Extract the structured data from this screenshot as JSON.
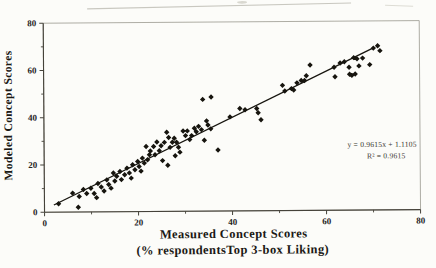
{
  "figure": {
    "background": "#fcfcf9",
    "ink": "#1a1813",
    "frame_color": "#9a988f",
    "axis_color": "#45423a",
    "marker_color": "#17150f",
    "trendline_color": "#17150f",
    "scan_artifact_color": "#c9c8c0"
  },
  "chart_data": {
    "type": "scatter",
    "title": "",
    "xlabel_line1": "Measured Concept Scores",
    "xlabel_line2": "(% respondentsTop 3-box Liking)",
    "ylabel": "Modeled Concept Scores",
    "xlim": [
      0,
      80
    ],
    "ylim": [
      0,
      80
    ],
    "xticks": [
      0,
      20,
      40,
      60,
      80
    ],
    "yticks": [
      0,
      20,
      40,
      60,
      80
    ],
    "minor_tick_step": 10,
    "grid": "off",
    "legend": "none",
    "marker": "diamond",
    "annotation": {
      "equation": "y = 0.9615x + 1.1105",
      "r_squared": "R² = 0.9615"
    },
    "trendline": {
      "slope": 0.9615,
      "intercept": 1.1105,
      "x_start": 2.0,
      "x_end": 70.3
    },
    "points": [
      [
        3.0,
        3.5
      ],
      [
        7.2,
        2.0
      ],
      [
        6.0,
        8.0
      ],
      [
        7.4,
        6.5
      ],
      [
        8.3,
        9.5
      ],
      [
        9.0,
        7.8
      ],
      [
        9.9,
        10.0
      ],
      [
        10.6,
        7.8
      ],
      [
        11.1,
        6.0
      ],
      [
        11.4,
        12.0
      ],
      [
        12.1,
        10.5
      ],
      [
        12.7,
        8.8
      ],
      [
        13.3,
        13.5
      ],
      [
        13.7,
        11.5
      ],
      [
        14.2,
        10.0
      ],
      [
        14.7,
        16.4
      ],
      [
        15.0,
        13.0
      ],
      [
        15.4,
        15.0
      ],
      [
        16.1,
        17.0
      ],
      [
        16.4,
        13.6
      ],
      [
        17.1,
        15.6
      ],
      [
        17.6,
        18.4
      ],
      [
        18.1,
        16.4
      ],
      [
        18.5,
        14.2
      ],
      [
        18.8,
        19.8
      ],
      [
        19.3,
        17.7
      ],
      [
        19.9,
        21.2
      ],
      [
        20.2,
        19.1
      ],
      [
        20.6,
        17.1
      ],
      [
        20.9,
        22.6
      ],
      [
        21.3,
        20.5
      ],
      [
        22.0,
        21.9
      ],
      [
        22.4,
        24.0
      ],
      [
        21.7,
        27.5
      ],
      [
        22.6,
        25.6
      ],
      [
        23.3,
        27.5
      ],
      [
        23.6,
        24.0
      ],
      [
        24.0,
        29.4
      ],
      [
        24.5,
        25.7
      ],
      [
        24.9,
        27.8
      ],
      [
        25.2,
        21.5
      ],
      [
        25.6,
        29.2
      ],
      [
        26.1,
        33.5
      ],
      [
        26.3,
        19.5
      ],
      [
        26.5,
        31.3
      ],
      [
        26.8,
        27.1
      ],
      [
        27.3,
        29.2
      ],
      [
        27.7,
        30.9
      ],
      [
        27.9,
        23.5
      ],
      [
        28.2,
        29.2
      ],
      [
        28.6,
        27.1
      ],
      [
        28.9,
        25.0
      ],
      [
        29.6,
        34.0
      ],
      [
        30.1,
        32.0
      ],
      [
        30.5,
        34.0
      ],
      [
        31.0,
        30.3
      ],
      [
        31.4,
        32.0
      ],
      [
        32.0,
        35.1
      ],
      [
        32.4,
        33.6
      ],
      [
        32.9,
        35.9
      ],
      [
        33.5,
        34.5
      ],
      [
        34.1,
        30.0
      ],
      [
        34.6,
        38.2
      ],
      [
        34.9,
        36.4
      ],
      [
        35.5,
        34.8
      ],
      [
        37.0,
        25.8
      ],
      [
        33.8,
        47.3
      ],
      [
        35.6,
        48.3
      ],
      [
        39.6,
        39.8
      ],
      [
        41.7,
        43.3
      ],
      [
        42.8,
        42.8
      ],
      [
        45.3,
        43.3
      ],
      [
        45.6,
        41.5
      ],
      [
        46.2,
        38.5
      ],
      [
        50.8,
        53.0
      ],
      [
        51.3,
        50.6
      ],
      [
        52.7,
        51.6
      ],
      [
        53.2,
        51.0
      ],
      [
        53.9,
        54.0
      ],
      [
        54.8,
        55.0
      ],
      [
        55.5,
        55.0
      ],
      [
        55.9,
        57.0
      ],
      [
        56.7,
        61.5
      ],
      [
        61.8,
        60.5
      ],
      [
        62.0,
        56.5
      ],
      [
        63.1,
        62.3
      ],
      [
        64.0,
        62.8
      ],
      [
        65.0,
        60.5
      ],
      [
        65.1,
        57.5
      ],
      [
        65.6,
        57.0
      ],
      [
        66.0,
        64.5
      ],
      [
        66.3,
        57.6
      ],
      [
        66.7,
        64.0
      ],
      [
        67.1,
        61.0
      ],
      [
        67.9,
        64.3
      ],
      [
        69.4,
        61.5
      ],
      [
        70.2,
        68.5
      ],
      [
        71.1,
        69.5
      ],
      [
        71.6,
        67.4
      ]
    ]
  }
}
